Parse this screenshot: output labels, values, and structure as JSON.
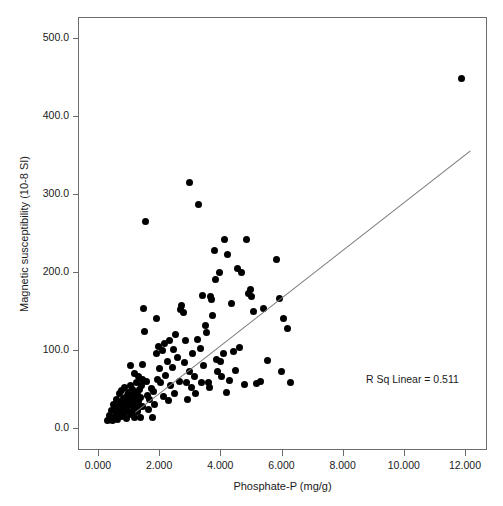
{
  "chart_data": {
    "type": "scatter",
    "title": "",
    "xlabel": "Phosphate-P (mg/g)",
    "ylabel": "Magnetic susceptibility (10-8 SI)",
    "xlim": [
      -0.65,
      13.0
    ],
    "ylim": [
      -28.0,
      528.0
    ],
    "xticks": [
      0,
      2,
      4,
      6,
      8,
      10,
      12
    ],
    "xticklabels": [
      "0.000",
      "2.000",
      "4.000",
      "6.000",
      "8.000",
      "10.000",
      "12.000"
    ],
    "yticks": [
      0,
      100,
      200,
      300,
      400,
      500
    ],
    "yticklabels": [
      "0.0",
      "100.0",
      "200.0",
      "300.0",
      "400.0",
      "500.0"
    ],
    "grid": false,
    "legend": null,
    "marker": {
      "shape": "circle",
      "color": "#000000",
      "size": 7
    },
    "annotations": [
      {
        "text": "R Sq Linear = 0.511",
        "x": 9.35,
        "y": 60
      }
    ],
    "fit_line": {
      "type": "linear",
      "r_squared": 0.511,
      "color": "#7a7a7a",
      "x_start": 1.2,
      "y_start": 20,
      "x_end": 12.15,
      "y_end": 355
    },
    "points": [
      [
        0.3,
        10
      ],
      [
        0.38,
        16
      ],
      [
        0.45,
        22
      ],
      [
        0.48,
        9
      ],
      [
        0.52,
        30
      ],
      [
        0.55,
        14
      ],
      [
        0.58,
        25
      ],
      [
        0.6,
        19
      ],
      [
        0.62,
        36
      ],
      [
        0.65,
        11
      ],
      [
        0.68,
        28
      ],
      [
        0.7,
        44
      ],
      [
        0.72,
        20
      ],
      [
        0.74,
        33
      ],
      [
        0.76,
        15
      ],
      [
        0.78,
        48
      ],
      [
        0.8,
        25
      ],
      [
        0.82,
        38
      ],
      [
        0.84,
        18
      ],
      [
        0.86,
        30
      ],
      [
        0.88,
        52
      ],
      [
        0.9,
        22
      ],
      [
        0.92,
        41
      ],
      [
        0.94,
        12
      ],
      [
        0.96,
        35
      ],
      [
        0.98,
        27
      ],
      [
        1.0,
        46
      ],
      [
        1.02,
        20
      ],
      [
        1.04,
        33
      ],
      [
        1.06,
        55
      ],
      [
        1.08,
        17
      ],
      [
        1.1,
        40
      ],
      [
        1.12,
        29
      ],
      [
        1.14,
        50
      ],
      [
        1.16,
        23
      ],
      [
        1.18,
        37
      ],
      [
        1.2,
        14
      ],
      [
        1.22,
        45
      ],
      [
        1.24,
        31
      ],
      [
        1.26,
        58
      ],
      [
        1.28,
        21
      ],
      [
        1.3,
        43
      ],
      [
        1.32,
        34
      ],
      [
        1.34,
        26
      ],
      [
        1.36,
        49
      ],
      [
        1.38,
        13
      ],
      [
        1.4,
        39
      ],
      [
        1.42,
        54
      ],
      [
        1.44,
        28
      ],
      [
        1.46,
        62
      ],
      [
        1.05,
        80
      ],
      [
        1.18,
        70
      ],
      [
        1.32,
        66
      ],
      [
        1.46,
        82
      ],
      [
        1.5,
        153
      ],
      [
        1.52,
        124
      ],
      [
        1.55,
        265
      ],
      [
        1.58,
        60
      ],
      [
        1.62,
        42
      ],
      [
        1.66,
        24
      ],
      [
        1.7,
        36
      ],
      [
        1.74,
        51
      ],
      [
        1.78,
        14
      ],
      [
        1.82,
        47
      ],
      [
        1.86,
        30
      ],
      [
        1.9,
        141
      ],
      [
        1.92,
        95
      ],
      [
        1.95,
        62
      ],
      [
        1.98,
        104
      ],
      [
        2.0,
        76
      ],
      [
        2.05,
        58
      ],
      [
        2.1,
        99
      ],
      [
        2.14,
        40
      ],
      [
        2.18,
        108
      ],
      [
        2.22,
        67
      ],
      [
        2.26,
        85
      ],
      [
        2.3,
        35
      ],
      [
        2.34,
        112
      ],
      [
        2.38,
        55
      ],
      [
        2.42,
        78
      ],
      [
        2.46,
        101
      ],
      [
        2.5,
        44
      ],
      [
        2.55,
        120
      ],
      [
        2.6,
        90
      ],
      [
        2.65,
        60
      ],
      [
        2.7,
        152
      ],
      [
        2.74,
        157
      ],
      [
        2.78,
        148
      ],
      [
        2.82,
        84
      ],
      [
        2.86,
        112
      ],
      [
        2.9,
        58
      ],
      [
        2.94,
        37
      ],
      [
        2.98,
        315
      ],
      [
        3.0,
        72
      ],
      [
        3.05,
        52
      ],
      [
        3.1,
        96
      ],
      [
        3.15,
        66
      ],
      [
        3.2,
        44
      ],
      [
        3.25,
        113
      ],
      [
        3.3,
        287
      ],
      [
        3.34,
        102
      ],
      [
        3.38,
        58
      ],
      [
        3.42,
        170
      ],
      [
        3.46,
        80
      ],
      [
        3.5,
        131
      ],
      [
        3.55,
        122
      ],
      [
        3.6,
        58
      ],
      [
        3.64,
        52
      ],
      [
        3.68,
        168
      ],
      [
        3.72,
        165
      ],
      [
        3.76,
        144
      ],
      [
        3.8,
        228
      ],
      [
        3.84,
        190
      ],
      [
        3.88,
        88
      ],
      [
        3.92,
        73
      ],
      [
        3.96,
        200
      ],
      [
        4.0,
        85
      ],
      [
        4.05,
        66
      ],
      [
        4.1,
        95
      ],
      [
        4.15,
        242
      ],
      [
        4.2,
        46
      ],
      [
        4.25,
        223
      ],
      [
        4.3,
        61
      ],
      [
        4.36,
        160
      ],
      [
        4.42,
        98
      ],
      [
        4.48,
        74
      ],
      [
        4.55,
        205
      ],
      [
        4.62,
        103
      ],
      [
        4.7,
        200
      ],
      [
        4.78,
        56
      ],
      [
        4.86,
        242
      ],
      [
        4.92,
        173
      ],
      [
        4.98,
        178
      ],
      [
        5.02,
        168
      ],
      [
        5.1,
        149
      ],
      [
        5.18,
        57
      ],
      [
        5.3,
        60
      ],
      [
        5.4,
        153
      ],
      [
        5.55,
        86
      ],
      [
        5.85,
        216
      ],
      [
        5.95,
        166
      ],
      [
        6.0,
        72
      ],
      [
        6.05,
        140
      ],
      [
        6.2,
        127
      ],
      [
        6.3,
        58
      ],
      [
        11.88,
        448
      ]
    ]
  }
}
